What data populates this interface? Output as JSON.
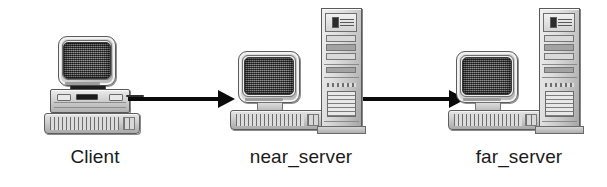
{
  "diagram": {
    "background_color": "#ffffff",
    "line_color": "#0b0b0b",
    "label_color": "#1a1a1a",
    "nodes": [
      {
        "id": "client",
        "label": "Client",
        "type": "desktop-computer",
        "parts": [
          "crt-monitor",
          "horizontal-case",
          "keyboard"
        ]
      },
      {
        "id": "near_server",
        "label": "near_server",
        "type": "server-workstation",
        "parts": [
          "crt-monitor",
          "keyboard",
          "tower-case"
        ]
      },
      {
        "id": "far_server",
        "label": "far_server",
        "type": "server-workstation",
        "parts": [
          "crt-monitor",
          "keyboard",
          "tower-case"
        ]
      }
    ],
    "connections": [
      {
        "id": "client-to-near",
        "from": "Client",
        "to": "near_server",
        "style": "solid-arrow",
        "direction": "right"
      },
      {
        "id": "near-to-far",
        "from": "near_server",
        "to": "far_server",
        "style": "solid-arrow",
        "direction": "right"
      }
    ]
  }
}
